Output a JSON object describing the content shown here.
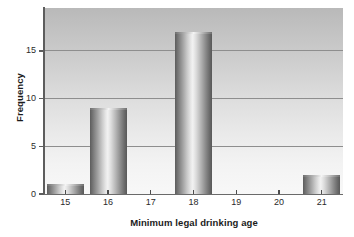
{
  "chart_data": {
    "type": "bar",
    "title": "",
    "subtitle": "",
    "xlabel": "Minimum legal drinking age",
    "ylabel": "Frequency",
    "categories": [
      "15",
      "16",
      "17",
      "18",
      "19",
      "20",
      "21"
    ],
    "values": [
      1,
      9,
      0,
      17,
      0,
      0,
      2
    ],
    "series": [
      {
        "name": "Frequency",
        "values": [
          1,
          9,
          0,
          17,
          0,
          0,
          2
        ]
      }
    ],
    "xtick_labels": [
      "15",
      "16",
      "17",
      "18",
      "19",
      "20",
      "21"
    ],
    "ytick_labels": [
      "0",
      "5",
      "10",
      "15"
    ],
    "ytick_values": [
      0,
      5,
      10,
      15
    ],
    "ylim": [
      0,
      19.5
    ],
    "xlim": [
      14.5,
      21.5
    ],
    "grid": "horizontal",
    "legend": "none",
    "bar_style": "3d-cylinder-gradient",
    "colors": {
      "bar_light": "#f2f2f2",
      "bar_dark": "#585858",
      "plot_background_top": "#b9b9b9",
      "plot_background_bottom": "#f8f8f8",
      "gridline": "#8e8e8e",
      "axis": "#5d5d5d",
      "text": "#1b1b1b",
      "page_background": "#ffffff"
    }
  }
}
